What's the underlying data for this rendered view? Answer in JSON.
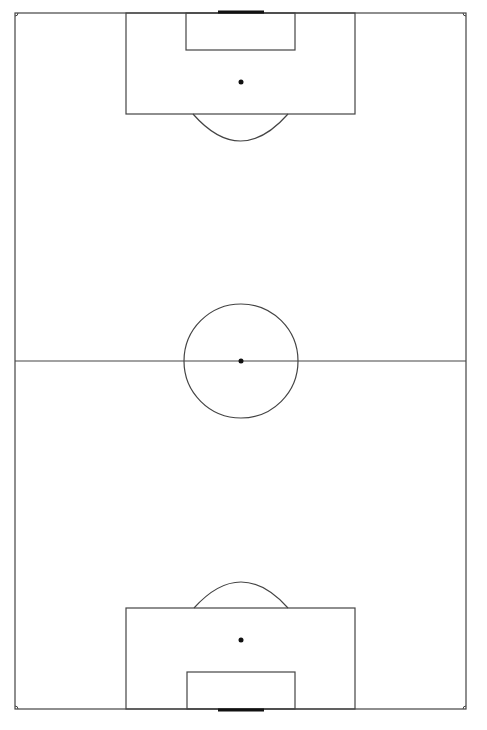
{
  "diagram": {
    "type": "soccer-pitch",
    "orientation": "vertical",
    "colors": {
      "background": "#ffffff",
      "line": "#444444",
      "goal": "#111111",
      "spot": "#111111"
    },
    "field": {
      "x": 15,
      "y": 13,
      "width": 451,
      "height": 696
    },
    "halfway_line_y": 361,
    "center_circle": {
      "cx": 241,
      "cy": 361,
      "r": 57
    },
    "center_spot": {
      "cx": 241,
      "cy": 361,
      "r": 2.5
    },
    "top": {
      "penalty_box": {
        "x": 126,
        "y": 13,
        "width": 229,
        "height": 101
      },
      "goal_box": {
        "x": 186,
        "y": 13,
        "width": 109,
        "height": 37
      },
      "penalty_spot": {
        "cx": 241,
        "cy": 82,
        "r": 2.5
      },
      "arc": {
        "x1": 193,
        "x2": 288,
        "y": 114,
        "depth": 27
      },
      "goal": {
        "x1": 218,
        "x2": 264,
        "y": 12
      }
    },
    "bottom": {
      "penalty_box": {
        "x": 126,
        "y": 608,
        "width": 229,
        "height": 101
      },
      "goal_box": {
        "x": 187,
        "y": 672,
        "width": 108,
        "height": 37
      },
      "penalty_spot": {
        "cx": 241,
        "cy": 640,
        "r": 2.5
      },
      "arc": {
        "x1": 194,
        "x2": 288,
        "y": 608,
        "depth": 26
      },
      "goal": {
        "x1": 218,
        "x2": 264,
        "y": 710
      }
    },
    "corner_arc_radius": 3
  }
}
